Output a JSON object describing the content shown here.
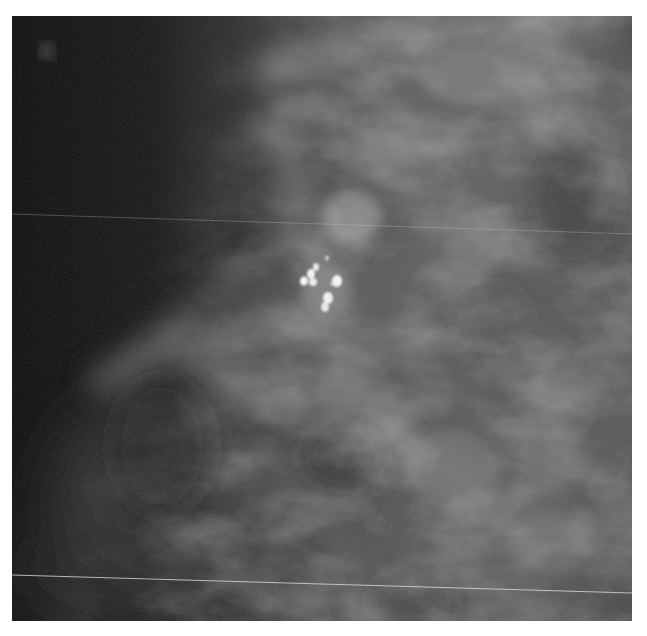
{
  "image": {
    "kind": "grayscale mammogram crop",
    "description": "Dense fibroglandular breast tissue with a cluster of bright microcalcifications near the center; darker fatty region on the left; two thin horizontal scan-line artifacts",
    "background_color": "#ffffff",
    "frame": {
      "x": 12,
      "y": 16,
      "width": 620,
      "height": 605
    },
    "colors": {
      "dark_region": "#0b0b0b",
      "tissue_mid": "#6a6a6a",
      "tissue_bright": "#9a9a9a",
      "calcification": "#f2f2f2",
      "artifact_line": "#d8d8d8"
    },
    "features": {
      "calcification_cluster": {
        "center_x": 318,
        "center_y": 280,
        "count": 8
      },
      "scan_lines": [
        {
          "from": [
            0,
            214
          ],
          "to": [
            620,
            236
          ],
          "opacity": 0.35
        },
        {
          "from": [
            0,
            558
          ],
          "to": [
            620,
            576
          ],
          "opacity": 0.8
        }
      ]
    }
  }
}
